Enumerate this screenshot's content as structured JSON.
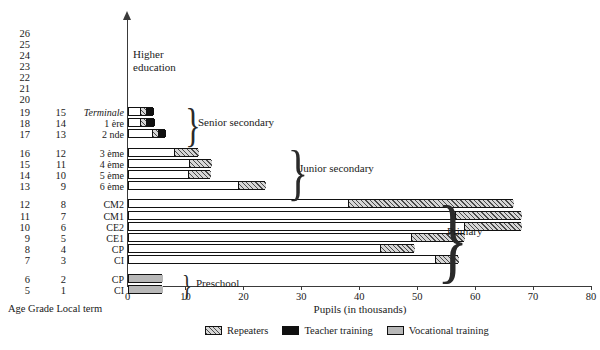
{
  "axes": {
    "x_title": "Pupils (in thousands)",
    "x_ticks": [
      "0",
      "10",
      "20",
      "30",
      "40",
      "50",
      "60",
      "70",
      "80"
    ],
    "column_caption": "Age Grade Local term"
  },
  "higher_education_label": "Higher\neducation",
  "stages": [
    {
      "name": "senior-secondary",
      "label": "Senior secondary"
    },
    {
      "name": "junior-secondary",
      "label": "Junior secondary"
    },
    {
      "name": "primary",
      "label": "Primary"
    },
    {
      "name": "preschool",
      "label": "Preschool"
    }
  ],
  "age_only_rows": [
    {
      "age": "26"
    },
    {
      "age": "25"
    },
    {
      "age": "24"
    },
    {
      "age": "23"
    },
    {
      "age": "22"
    },
    {
      "age": "21"
    },
    {
      "age": "20"
    }
  ],
  "legend": [
    {
      "name": "repeaters",
      "label": "Repeaters",
      "pattern": "hatch"
    },
    {
      "name": "teacher-training",
      "label": "Teacher training",
      "pattern": "black"
    },
    {
      "name": "vocational-training",
      "label": "Vocational training",
      "pattern": "gray"
    }
  ],
  "colors": {
    "axis": "#3a3a3a",
    "bar_outline": "#111111",
    "plain": "#ffffff",
    "hatch": "#d6d6d6",
    "black": "#101010",
    "gray": "#b8b8b8"
  },
  "chart_data": {
    "type": "bar",
    "orientation": "horizontal",
    "title": "",
    "xlabel": "Pupils (in thousands)",
    "ylabel": "Age / Grade / Local term",
    "xlim": [
      0,
      80
    ],
    "xticks": [
      0,
      10,
      20,
      30,
      40,
      50,
      60,
      70,
      80
    ],
    "grid": false,
    "legend_position": "bottom",
    "series": [
      {
        "name": "Main enrolment",
        "pattern": "plain"
      },
      {
        "name": "Repeaters",
        "pattern": "hatch"
      },
      {
        "name": "Teacher training",
        "pattern": "black"
      },
      {
        "name": "Vocational training",
        "pattern": "gray"
      }
    ],
    "rows": [
      {
        "age": "19",
        "grade": "15",
        "term": "Terminale",
        "italic": true,
        "stage": "senior-secondary",
        "segments": [
          {
            "series": "Main enrolment",
            "value": 2.1
          },
          {
            "series": "Repeaters",
            "value": 1.1
          },
          {
            "series": "Teacher training",
            "value": 1.2
          }
        ],
        "total": 4.4
      },
      {
        "age": "18",
        "grade": "14",
        "term": "1 ère",
        "italic": false,
        "stage": "senior-secondary",
        "segments": [
          {
            "series": "Main enrolment",
            "value": 2.2
          },
          {
            "series": "Repeaters",
            "value": 1.0
          },
          {
            "series": "Teacher training",
            "value": 1.3
          }
        ],
        "total": 4.5
      },
      {
        "age": "17",
        "grade": "13",
        "term": "2 nde",
        "italic": false,
        "stage": "senior-secondary",
        "segments": [
          {
            "series": "Main enrolment",
            "value": 4.2
          },
          {
            "series": "Repeaters",
            "value": 1.0
          },
          {
            "series": "Teacher training",
            "value": 1.3
          }
        ],
        "total": 6.5
      },
      {
        "age": "16",
        "grade": "12",
        "term": "3 ème",
        "italic": false,
        "stage": "junior-secondary",
        "segments": [
          {
            "series": "Main enrolment",
            "value": 8.0
          },
          {
            "series": "Repeaters",
            "value": 4.1
          }
        ],
        "total": 12.1
      },
      {
        "age": "15",
        "grade": "11",
        "term": "4 ème",
        "italic": false,
        "stage": "junior-secondary",
        "segments": [
          {
            "series": "Main enrolment",
            "value": 10.6
          },
          {
            "series": "Repeaters",
            "value": 3.8
          }
        ],
        "total": 14.4
      },
      {
        "age": "14",
        "grade": "10",
        "term": "5 ème",
        "italic": false,
        "stage": "junior-secondary",
        "segments": [
          {
            "series": "Main enrolment",
            "value": 10.5
          },
          {
            "series": "Repeaters",
            "value": 3.7
          }
        ],
        "total": 14.2
      },
      {
        "age": "13",
        "grade": "9",
        "term": "6 ème",
        "italic": false,
        "stage": "junior-secondary",
        "segments": [
          {
            "series": "Main enrolment",
            "value": 19.0
          },
          {
            "series": "Repeaters",
            "value": 4.8
          }
        ],
        "total": 23.8
      },
      {
        "age": "12",
        "grade": "8",
        "term": "CM2",
        "italic": false,
        "stage": "primary",
        "segments": [
          {
            "series": "Main enrolment",
            "value": 38.0
          },
          {
            "series": "Repeaters",
            "value": 28.5
          }
        ],
        "total": 66.5
      },
      {
        "age": "11",
        "grade": "7",
        "term": "CM1",
        "italic": false,
        "stage": "primary",
        "segments": [
          {
            "series": "Main enrolment",
            "value": 56.5
          },
          {
            "series": "Repeaters",
            "value": 11.5
          }
        ],
        "total": 68.0
      },
      {
        "age": "10",
        "grade": "6",
        "term": "CE2",
        "italic": false,
        "stage": "primary",
        "segments": [
          {
            "series": "Main enrolment",
            "value": 58.0
          },
          {
            "series": "Repeaters",
            "value": 10.0
          }
        ],
        "total": 68.0
      },
      {
        "age": "9",
        "grade": "5",
        "term": "CE1",
        "italic": false,
        "stage": "primary",
        "segments": [
          {
            "series": "Main enrolment",
            "value": 49.0
          },
          {
            "series": "Repeaters",
            "value": 9.0
          }
        ],
        "total": 58.0
      },
      {
        "age": "8",
        "grade": "4",
        "term": "CP",
        "italic": false,
        "stage": "primary",
        "segments": [
          {
            "series": "Main enrolment",
            "value": 43.5
          },
          {
            "series": "Repeaters",
            "value": 6.0
          }
        ],
        "total": 49.5
      },
      {
        "age": "7",
        "grade": "3",
        "term": "CI",
        "italic": false,
        "stage": "primary",
        "segments": [
          {
            "series": "Main enrolment",
            "value": 53.0
          },
          {
            "series": "Repeaters",
            "value": 4.0
          }
        ],
        "total": 57.0
      },
      {
        "age": "6",
        "grade": "2",
        "term": "CP",
        "italic": false,
        "stage": "preschool",
        "segments": [
          {
            "series": "Vocational training",
            "value": 6.0
          }
        ],
        "total": 6.0
      },
      {
        "age": "5",
        "grade": "1",
        "term": "CI",
        "italic": false,
        "stage": "preschool",
        "segments": [
          {
            "series": "Vocational training",
            "value": 6.0
          }
        ],
        "total": 6.0
      }
    ]
  }
}
